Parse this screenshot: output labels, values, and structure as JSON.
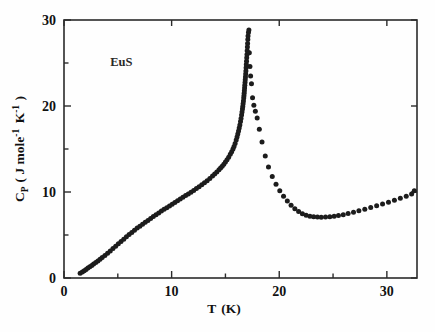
{
  "figure": {
    "background_color": "#fefefe",
    "ink_color": "#1c1c1c",
    "annotation": "EuS"
  },
  "chart_data": {
    "type": "scatter",
    "title": "",
    "subtitle": "",
    "xlabel": "T (K)",
    "ylabel": "C_P ( J mole^-1 K^-1 )",
    "ylabel_parts": {
      "symbol": "C",
      "subscript": "P",
      "open_paren": "( J mole",
      "exp1": "-1",
      "mid": " K",
      "exp2": "-1",
      "close_paren": " )"
    },
    "xlabel_parts": {
      "symbol": "T",
      "unit": "(K)"
    },
    "xlim": [
      0,
      32.8
    ],
    "ylim": [
      0,
      30
    ],
    "xticks": [
      0,
      10,
      20,
      30
    ],
    "yticks": [
      0,
      10,
      20,
      30
    ],
    "xticklabels": [
      "0",
      "10",
      "20",
      "30"
    ],
    "yticklabels": [
      "0",
      "10",
      "20",
      "30"
    ],
    "xminorticks": [
      5,
      15,
      25
    ],
    "yminorticks": [
      5,
      15,
      25
    ],
    "grid": false,
    "legend": null,
    "annotations": [
      {
        "text": "EuS",
        "x": 4.3,
        "y": 24.6
      }
    ],
    "series": [
      {
        "name": "EuS heat capacity",
        "marker": "filled-circle",
        "color": "#1c1c1c",
        "x": [
          1.5,
          1.7,
          1.88,
          2.05,
          2.22,
          2.4,
          2.58,
          2.75,
          2.95,
          3.15,
          3.35,
          3.55,
          3.8,
          4.05,
          4.3,
          4.55,
          4.8,
          5.05,
          5.3,
          5.55,
          5.8,
          6.05,
          6.3,
          6.55,
          6.8,
          7.05,
          7.3,
          7.55,
          7.8,
          8.05,
          8.3,
          8.55,
          8.8,
          9.05,
          9.3,
          9.55,
          9.8,
          10.05,
          10.3,
          10.55,
          10.8,
          11.05,
          11.3,
          11.55,
          11.8,
          12.05,
          12.3,
          12.55,
          12.8,
          13.05,
          13.3,
          13.55,
          13.8,
          14.0,
          14.2,
          14.4,
          14.55,
          14.7,
          14.85,
          15.0,
          15.15,
          15.3,
          15.45,
          15.58,
          15.7,
          15.8,
          15.9,
          16.0,
          16.08,
          16.15,
          16.22,
          16.28,
          16.34,
          16.4,
          16.45,
          16.5,
          16.54,
          16.58,
          16.61,
          16.64,
          16.67,
          16.7,
          16.72,
          16.74,
          16.76,
          16.78,
          16.8,
          16.82,
          16.84,
          16.86,
          16.88,
          16.9,
          16.92,
          16.94,
          16.96,
          16.98,
          17.0,
          17.02,
          17.04,
          17.06,
          17.08,
          17.1,
          17.14,
          17.18,
          17.22,
          17.28,
          17.34,
          17.42,
          17.52,
          17.64,
          17.78,
          17.95,
          18.15,
          18.4,
          18.7,
          19.0,
          19.35,
          19.7,
          20.05,
          20.4,
          20.75,
          21.1,
          21.45,
          21.8,
          22.15,
          22.5,
          22.85,
          23.2,
          23.55,
          23.9,
          24.3,
          24.7,
          25.1,
          25.5,
          25.95,
          26.4,
          26.9,
          27.4,
          27.95,
          28.5,
          29.05,
          29.6,
          30.15,
          30.7,
          31.25,
          31.8,
          32.3,
          32.55
        ],
        "y": [
          0.55,
          0.7,
          0.85,
          1.0,
          1.15,
          1.3,
          1.45,
          1.62,
          1.8,
          1.98,
          2.18,
          2.38,
          2.62,
          2.88,
          3.15,
          3.42,
          3.7,
          3.98,
          4.25,
          4.52,
          4.8,
          5.05,
          5.3,
          5.55,
          5.8,
          6.02,
          6.25,
          6.48,
          6.7,
          6.92,
          7.14,
          7.35,
          7.56,
          7.78,
          7.98,
          8.18,
          8.38,
          8.58,
          8.78,
          8.98,
          9.18,
          9.38,
          9.58,
          9.78,
          9.98,
          10.18,
          10.4,
          10.62,
          10.85,
          11.08,
          11.32,
          11.58,
          11.85,
          12.08,
          12.32,
          12.58,
          12.78,
          13.0,
          13.22,
          13.48,
          13.75,
          14.05,
          14.38,
          14.68,
          15.0,
          15.3,
          15.65,
          16.05,
          16.4,
          16.75,
          17.1,
          17.45,
          17.8,
          18.2,
          18.55,
          18.95,
          19.3,
          19.65,
          19.95,
          20.25,
          20.58,
          20.92,
          21.2,
          21.48,
          21.78,
          22.08,
          22.4,
          22.72,
          23.05,
          23.38,
          23.72,
          24.08,
          24.45,
          24.82,
          25.2,
          25.6,
          26.0,
          26.42,
          26.85,
          27.28,
          27.72,
          28.15,
          28.55,
          28.85,
          26.2,
          24.6,
          23.5,
          22.6,
          20.95,
          20.1,
          19.4,
          18.6,
          17.3,
          15.8,
          14.2,
          12.9,
          11.8,
          10.9,
          10.15,
          9.5,
          8.95,
          8.45,
          8.05,
          7.72,
          7.48,
          7.3,
          7.18,
          7.12,
          7.08,
          7.06,
          7.08,
          7.12,
          7.18,
          7.26,
          7.36,
          7.5,
          7.64,
          7.82,
          8.0,
          8.2,
          8.4,
          8.6,
          8.82,
          9.05,
          9.28,
          9.52,
          9.78,
          10.15
        ]
      }
    ]
  }
}
